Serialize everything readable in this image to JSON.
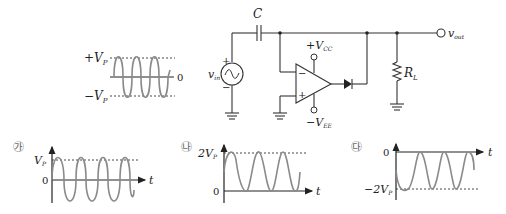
{
  "input_waveform": {
    "pos_label": "+V",
    "pos_sub": "P",
    "neg_label": "−V",
    "neg_sub": "P",
    "zero_label": "0"
  },
  "circuit": {
    "capacitor_label": "C",
    "source_label": "v",
    "source_sub": "in",
    "source_plus": "+",
    "source_minus": "−",
    "vcc_label": "+V",
    "vcc_sub": "CC",
    "vee_label": "−V",
    "vee_sub": "EE",
    "opamp_minus": "−",
    "opamp_plus": "+",
    "load_label": "R",
    "load_sub": "L",
    "output_label": "v",
    "output_sub": "out"
  },
  "options": [
    {
      "marker": "㉮",
      "top_label": "V",
      "top_sub": "P",
      "zero_label": "0",
      "axis_label": "t"
    },
    {
      "marker": "㉯",
      "top_label": "2V",
      "top_sub": "P",
      "zero_label": "0",
      "axis_label": "t"
    },
    {
      "marker": "㉰",
      "zero_label": "0",
      "bottom_label": "−2V",
      "bottom_sub": "P",
      "axis_label": "t"
    }
  ]
}
